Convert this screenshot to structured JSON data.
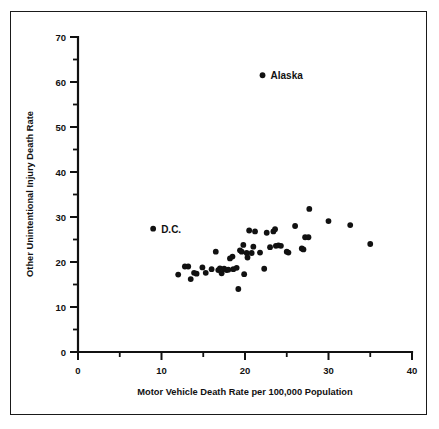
{
  "chart_data": {
    "type": "scatter",
    "title": "",
    "xlabel": "Motor Vehicle Death Rate per 100,000 Population",
    "ylabel": "Other Unintentional Injury Death Rate",
    "xlim": [
      0,
      40
    ],
    "ylim": [
      0,
      70
    ],
    "xticks": [
      0,
      10,
      20,
      30,
      40
    ],
    "yticks": [
      0,
      10,
      20,
      30,
      40,
      50,
      60,
      70
    ],
    "xtick_labels": [
      "0",
      "10",
      "20",
      "30",
      "40"
    ],
    "ytick_labels": [
      "0",
      "10",
      "20",
      "30",
      "40",
      "50",
      "60",
      "70"
    ],
    "minor_tick_interval": 5,
    "grid": false,
    "legend": false,
    "marker": "filled-circle",
    "marker_color": "#111111",
    "annotations": [
      {
        "label": "Alaska",
        "x": 22.1,
        "y": 61.5
      },
      {
        "label": "D.C.",
        "x": 9.0,
        "y": 27.4
      }
    ],
    "points": [
      {
        "x": 22.1,
        "y": 61.5,
        "label": "Alaska"
      },
      {
        "x": 9.0,
        "y": 27.4,
        "label": "D.C."
      },
      {
        "x": 12.0,
        "y": 17.2
      },
      {
        "x": 12.8,
        "y": 19.0
      },
      {
        "x": 13.2,
        "y": 19.0
      },
      {
        "x": 13.5,
        "y": 16.2
      },
      {
        "x": 13.9,
        "y": 17.6
      },
      {
        "x": 14.2,
        "y": 17.4
      },
      {
        "x": 14.9,
        "y": 18.8
      },
      {
        "x": 15.3,
        "y": 17.6
      },
      {
        "x": 16.0,
        "y": 18.4
      },
      {
        "x": 16.5,
        "y": 22.3
      },
      {
        "x": 16.8,
        "y": 18.2
      },
      {
        "x": 17.0,
        "y": 18.6
      },
      {
        "x": 17.2,
        "y": 17.5
      },
      {
        "x": 17.5,
        "y": 18.5
      },
      {
        "x": 17.8,
        "y": 18.2
      },
      {
        "x": 18.0,
        "y": 18.3
      },
      {
        "x": 18.2,
        "y": 20.8
      },
      {
        "x": 18.5,
        "y": 21.2
      },
      {
        "x": 18.6,
        "y": 18.4
      },
      {
        "x": 19.0,
        "y": 18.7
      },
      {
        "x": 19.2,
        "y": 14.0
      },
      {
        "x": 19.4,
        "y": 22.6
      },
      {
        "x": 19.6,
        "y": 22.3
      },
      {
        "x": 19.8,
        "y": 23.8
      },
      {
        "x": 19.9,
        "y": 17.3
      },
      {
        "x": 20.2,
        "y": 22.0
      },
      {
        "x": 20.3,
        "y": 21.0
      },
      {
        "x": 20.5,
        "y": 27.0
      },
      {
        "x": 20.8,
        "y": 22.0
      },
      {
        "x": 21.0,
        "y": 23.4
      },
      {
        "x": 21.2,
        "y": 26.8
      },
      {
        "x": 21.8,
        "y": 22.1
      },
      {
        "x": 22.3,
        "y": 18.5
      },
      {
        "x": 22.6,
        "y": 26.5
      },
      {
        "x": 23.0,
        "y": 23.3
      },
      {
        "x": 23.4,
        "y": 26.8
      },
      {
        "x": 23.6,
        "y": 27.3
      },
      {
        "x": 23.7,
        "y": 23.6
      },
      {
        "x": 24.0,
        "y": 23.7
      },
      {
        "x": 24.3,
        "y": 23.6
      },
      {
        "x": 25.0,
        "y": 22.3
      },
      {
        "x": 25.2,
        "y": 22.1
      },
      {
        "x": 26.0,
        "y": 28.0
      },
      {
        "x": 26.8,
        "y": 23.0
      },
      {
        "x": 27.0,
        "y": 22.8
      },
      {
        "x": 27.2,
        "y": 25.5
      },
      {
        "x": 27.6,
        "y": 25.5
      },
      {
        "x": 27.7,
        "y": 31.8
      },
      {
        "x": 30.0,
        "y": 29.1
      },
      {
        "x": 32.6,
        "y": 28.2
      },
      {
        "x": 35.0,
        "y": 24.0
      }
    ]
  }
}
